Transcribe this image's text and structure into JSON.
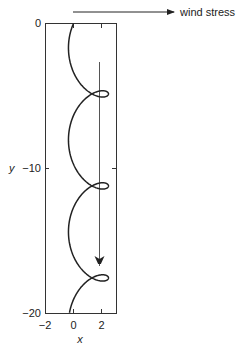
{
  "chart_data": {
    "type": "line",
    "title": "",
    "xlabel": "x",
    "ylabel": "y",
    "xlim": [
      -2,
      3
    ],
    "ylim": [
      -20,
      0
    ],
    "x_ticks": [
      "-2",
      "0",
      "2"
    ],
    "y_ticks": [
      "0",
      "-10",
      "-20"
    ],
    "annotation": {
      "label": "wind stress",
      "direction": "right"
    },
    "mean_drift_arrow": {
      "x": 1.85,
      "y_start": -2.7,
      "y_end": -16.8,
      "direction": "down"
    },
    "series": [
      {
        "name": "trajectory",
        "description": "looping (trochoidal) path drifting in -y, loops at y≈-6.4, -12.7, -19.0",
        "x": [
          0,
          1.2,
          2.1,
          2.5,
          2.2,
          1.3,
          0.5,
          -0.3,
          0.2,
          1.4,
          2.3,
          2.5,
          2.1,
          1.2,
          0.5,
          -0.3,
          0.2,
          1.4,
          2.3,
          2.5,
          2.1,
          1.2,
          0.5,
          -0.3,
          0.3,
          1.8
        ],
        "y": [
          0,
          -0.4,
          -1.5,
          -3.1,
          -4.6,
          -5.8,
          -6.3,
          -6.4,
          -6.6,
          -7.6,
          -8.9,
          -10.3,
          -11.5,
          -12.2,
          -12.6,
          -12.7,
          -12.9,
          -13.9,
          -15.2,
          -16.6,
          -17.8,
          -18.5,
          -18.9,
          -19.0,
          -19.2,
          -20.0
        ]
      }
    ]
  },
  "labels": {
    "wind": "wind stress",
    "x_axis": "x",
    "y_axis": "y",
    "xt0": "−2",
    "xt1": "0",
    "xt2": "2",
    "yt0": "0",
    "yt1": "−10",
    "yt2": "−20"
  }
}
